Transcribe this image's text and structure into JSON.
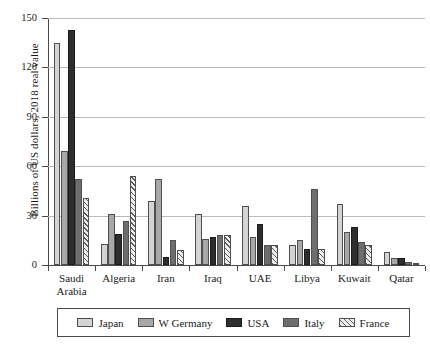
{
  "chart_data": {
    "type": "bar",
    "title": "",
    "subtitle": "",
    "xlabel": "",
    "ylabel": "Billions of US dollars, 2018 real value",
    "ylim": [
      0,
      150
    ],
    "yticks": [
      0,
      30,
      60,
      90,
      120,
      150
    ],
    "ytick_labels": [
      "0",
      "30",
      "60",
      "90",
      "120",
      "150"
    ],
    "grid": true,
    "legend_position": "bottom",
    "categories": [
      "Saudi Arabia",
      "Algeria",
      "Iran",
      "Iraq",
      "UAE",
      "Libya",
      "Kuwait",
      "Qatar"
    ],
    "category_lines": [
      [
        "Saudi",
        "Arabia"
      ],
      [
        "Algeria"
      ],
      [
        "Iran"
      ],
      [
        "Iraq"
      ],
      [
        "UAE"
      ],
      [
        "Libya"
      ],
      [
        "Kuwait"
      ],
      [
        "Qatar"
      ]
    ],
    "series": [
      {
        "name": "Japan",
        "color": "#d4d4d4",
        "pattern": "solid",
        "values": [
          135,
          13,
          39,
          31,
          36,
          12,
          37,
          8
        ]
      },
      {
        "name": "W Germany",
        "color": "#a8a8a8",
        "pattern": "solid",
        "values": [
          69,
          31,
          52,
          16,
          17,
          15,
          20,
          4
        ]
      },
      {
        "name": "USA",
        "color": "#2e2e2e",
        "pattern": "solid",
        "values": [
          143,
          19,
          5,
          17,
          25,
          10,
          23,
          4
        ]
      },
      {
        "name": "Italy",
        "color": "#6e6e6e",
        "pattern": "solid",
        "values": [
          52,
          27,
          15,
          18,
          12,
          46,
          14,
          2
        ]
      },
      {
        "name": "France",
        "color": "#e8e8e8",
        "pattern": "diagonal-hatch",
        "values": [
          41,
          54,
          9,
          18,
          12,
          10,
          12,
          1
        ]
      }
    ]
  }
}
